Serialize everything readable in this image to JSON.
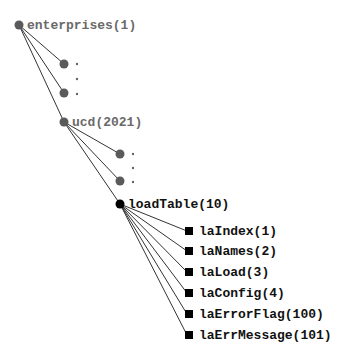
{
  "diagram": {
    "type": "tree",
    "colors": {
      "gray_node": "#5a5a5a",
      "black_node": "#000000",
      "edge": "#333333",
      "gray_text": "#6a6a6a",
      "black_text": "#111111"
    },
    "root": {
      "label": "enterprises(1)",
      "x": 19,
      "y": 25
    },
    "enterprise_siblings": [
      {
        "x": 64,
        "y": 64
      },
      {
        "x": 64,
        "y": 93
      }
    ],
    "enterprise_ellipsis": [
      {
        "x": 77,
        "y": 64
      },
      {
        "x": 77,
        "y": 79
      },
      {
        "x": 77,
        "y": 94
      }
    ],
    "ucd": {
      "label": "ucd(2021)",
      "x": 64,
      "y": 122
    },
    "ucd_siblings": [
      {
        "x": 120,
        "y": 154
      },
      {
        "x": 120,
        "y": 181
      }
    ],
    "ucd_ellipsis": [
      {
        "x": 133,
        "y": 154
      },
      {
        "x": 133,
        "y": 168
      },
      {
        "x": 133,
        "y": 182
      }
    ],
    "loadTable": {
      "label": "loadTable(10)",
      "x": 120,
      "y": 204
    },
    "leaves": [
      {
        "label": "laIndex(1)",
        "x": 189,
        "y": 231
      },
      {
        "label": "laNames(2)",
        "x": 189,
        "y": 251
      },
      {
        "label": "laLoad(3)",
        "x": 189,
        "y": 272
      },
      {
        "label": "laConfig(4)",
        "x": 189,
        "y": 293
      },
      {
        "label": "laErrorFlag(100)",
        "x": 189,
        "y": 314
      },
      {
        "label": "laErrMessage(101)",
        "x": 189,
        "y": 335
      }
    ]
  }
}
